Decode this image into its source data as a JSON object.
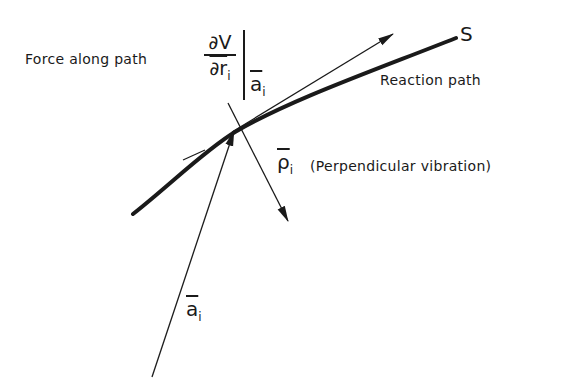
{
  "diagram": {
    "labels": {
      "force_along_path": "Force along path",
      "derivative_numerator": "∂V",
      "derivative_denominator": "∂r",
      "derivative_denominator_sub": "i",
      "evaluated_at": "a",
      "evaluated_at_sub": "i",
      "reaction_path": "Reaction path",
      "path_end": "S",
      "rho_symbol": "ρ",
      "rho_sub": "i",
      "perpendicular_vibration": "(Perpendicular vibration)",
      "position_vector": "a",
      "position_vector_sub": "i"
    },
    "colors": {
      "ink": "#1a1a1a",
      "background": "#ffffff"
    }
  }
}
